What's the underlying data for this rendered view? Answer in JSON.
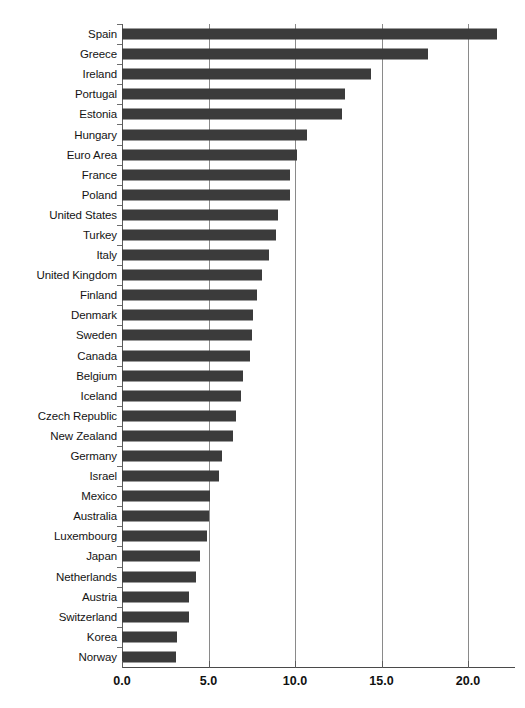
{
  "scan_artifact_text": "",
  "chart_data": {
    "type": "bar",
    "orientation": "horizontal",
    "title": "",
    "subtitle": "",
    "xlabel": "",
    "ylabel": "",
    "xlim": [
      0.0,
      22.5
    ],
    "ylim": null,
    "grid": true,
    "grid_axis": "x",
    "legend": null,
    "legend_position": "none",
    "bar_color": "#3b3b3b",
    "background_color": "#ffffff",
    "gridline_color": "#8a8a8a",
    "axis_color": "#4a4a4a",
    "xticks": [
      0.0,
      5.0,
      10.0,
      15.0,
      20.0
    ],
    "xticklabels": [
      "0.0",
      "5.0",
      "10.0",
      "15.0",
      "20.0"
    ],
    "categories": [
      "Spain",
      "Greece",
      "Ireland",
      "Portugal",
      "Estonia",
      "Hungary",
      "Euro Area",
      "France",
      "Poland",
      "United States",
      "Turkey",
      "Italy",
      "United Kingdom",
      "Finland",
      "Denmark",
      "Sweden",
      "Canada",
      "Belgium",
      "Iceland",
      "Czech Republic",
      "New Zealand",
      "Germany",
      "Israel",
      "Mexico",
      "Australia",
      "Luxembourg",
      "Japan",
      "Netherlands",
      "Austria",
      "Switzerland",
      "Korea",
      "Norway"
    ],
    "values": [
      21.7,
      17.7,
      14.4,
      12.9,
      12.7,
      10.7,
      10.1,
      9.7,
      9.7,
      9.0,
      8.9,
      8.5,
      8.1,
      7.8,
      7.6,
      7.5,
      7.4,
      7.0,
      6.9,
      6.6,
      6.4,
      5.8,
      5.6,
      5.1,
      5.0,
      4.9,
      4.5,
      4.3,
      3.9,
      3.9,
      3.2,
      3.1
    ]
  }
}
